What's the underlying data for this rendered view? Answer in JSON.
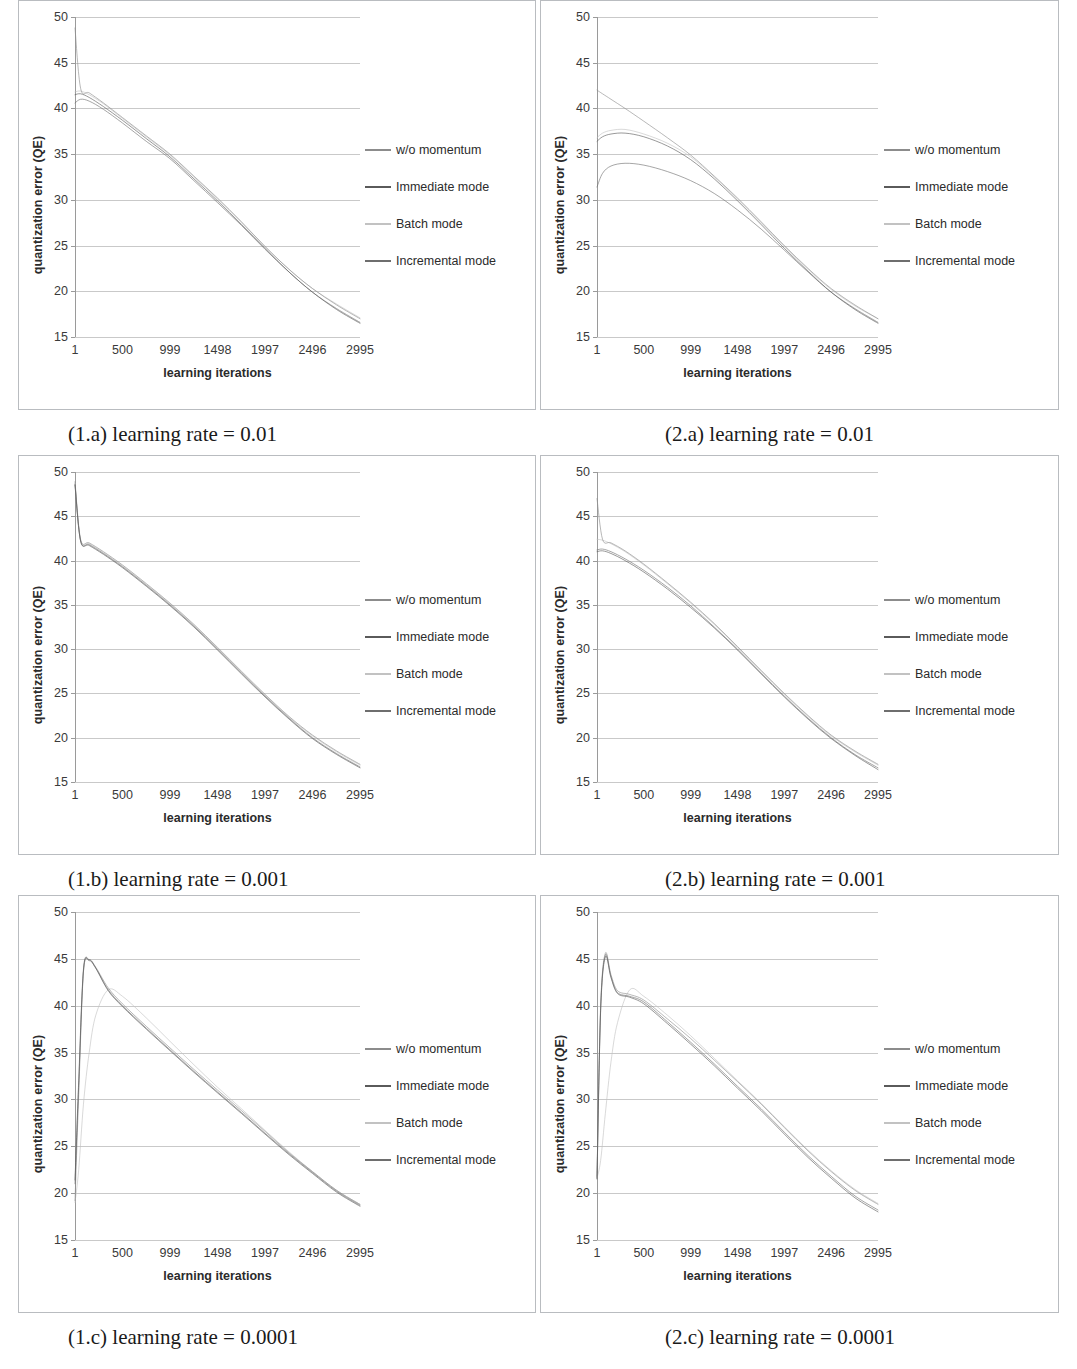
{
  "figure": {
    "rows": [
      {
        "left_caption": "(1.a) learning rate = 0.01",
        "right_caption": "(2.a) learning rate = 0.01"
      },
      {
        "left_caption": "(1.b) learning rate = 0.001",
        "right_caption": "(2.b) learning rate = 0.001"
      },
      {
        "left_caption": "(1.c) learning rate = 0.0001",
        "right_caption": "(2.c) learning rate = 0.0001"
      }
    ]
  },
  "axes": {
    "ylabel": "quantization error (QE)",
    "xlabel": "learning iterations",
    "yticks": [
      50,
      45,
      40,
      35,
      30,
      25,
      20,
      15
    ],
    "xticks": [
      1,
      500,
      999,
      1498,
      1997,
      2496,
      2995
    ],
    "ylim": [
      15,
      50
    ],
    "xlim": [
      1,
      2995
    ]
  },
  "legend": {
    "entries": [
      {
        "label": "w/o momentum",
        "color": "#8c8c8c"
      },
      {
        "label": "Immediate mode",
        "color": "#5a5a5a"
      },
      {
        "label": "Batch mode",
        "color": "#c2c2c2"
      },
      {
        "label": "Incremental mode",
        "color": "#6e6e6e"
      }
    ]
  },
  "colors": {
    "panel_border": "#b9bcc0",
    "gridline": "#c9c9c9",
    "axis": "#9a9a9a",
    "text": "#2b2b2b",
    "background": "#ffffff"
  },
  "chart_data": [
    {
      "id": "1a",
      "type": "line",
      "title": "(1.a) learning rate = 0.01",
      "xlabel": "learning iterations",
      "ylabel": "quantization error (QE)",
      "xlim": [
        1,
        2995
      ],
      "ylim": [
        15,
        50
      ],
      "grid": true,
      "legend_position": "right",
      "x": [
        1,
        60,
        150,
        300,
        500,
        750,
        999,
        1250,
        1498,
        1750,
        1997,
        2250,
        2496,
        2750,
        2995
      ],
      "series": [
        {
          "name": "w/o momentum",
          "color": "#8c8c8c",
          "values": [
            48.8,
            42.2,
            41.7,
            40.6,
            39.0,
            37.0,
            35.0,
            32.6,
            30.2,
            27.6,
            24.9,
            22.4,
            20.3,
            18.5,
            17.0
          ]
        },
        {
          "name": "Immediate mode",
          "color": "#5a5a5a",
          "values": [
            41.5,
            41.6,
            41.2,
            40.2,
            38.7,
            36.7,
            34.7,
            32.3,
            29.9,
            27.3,
            24.7,
            22.1,
            19.9,
            18.0,
            16.5
          ]
        },
        {
          "name": "Batch mode",
          "color": "#c2c2c2",
          "values": [
            41.8,
            41.9,
            41.5,
            40.5,
            38.9,
            36.9,
            34.9,
            32.5,
            30.1,
            27.5,
            24.9,
            22.4,
            20.3,
            18.6,
            17.1
          ]
        },
        {
          "name": "Incremental mode",
          "color": "#6e6e6e",
          "values": [
            40.6,
            41.0,
            40.8,
            39.9,
            38.4,
            36.4,
            34.5,
            32.1,
            29.7,
            27.2,
            24.6,
            22.1,
            19.9,
            18.1,
            16.6
          ]
        }
      ]
    },
    {
      "id": "2a",
      "type": "line",
      "title": "(2.a) learning rate = 0.01",
      "xlabel": "learning iterations",
      "ylabel": "quantization error (QE)",
      "xlim": [
        1,
        2995
      ],
      "ylim": [
        15,
        50
      ],
      "grid": true,
      "legend_position": "right",
      "x": [
        1,
        60,
        150,
        300,
        500,
        750,
        999,
        1250,
        1498,
        1750,
        1997,
        2250,
        2496,
        2750,
        2995
      ],
      "series": [
        {
          "name": "w/o momentum",
          "color": "#8c8c8c",
          "values": [
            42.0,
            41.6,
            41.0,
            40.0,
            38.6,
            36.8,
            34.9,
            32.6,
            30.2,
            27.6,
            25.0,
            22.5,
            20.3,
            18.5,
            17.0
          ]
        },
        {
          "name": "Immediate mode",
          "color": "#5a5a5a",
          "values": [
            36.4,
            36.9,
            37.2,
            37.3,
            36.9,
            35.9,
            34.4,
            32.3,
            29.9,
            27.3,
            24.7,
            22.2,
            19.9,
            18.0,
            16.5
          ]
        },
        {
          "name": "Batch mode",
          "color": "#c2c2c2",
          "values": [
            36.8,
            37.3,
            37.6,
            37.7,
            37.2,
            36.2,
            34.7,
            32.5,
            30.1,
            27.5,
            24.9,
            22.4,
            20.2,
            18.4,
            17.0
          ]
        },
        {
          "name": "Incremental mode",
          "color": "#6e6e6e",
          "values": [
            31.4,
            32.9,
            33.7,
            34.0,
            33.8,
            33.1,
            32.1,
            30.7,
            28.9,
            26.8,
            24.5,
            22.1,
            19.9,
            18.1,
            16.6
          ]
        }
      ]
    },
    {
      "id": "1b",
      "type": "line",
      "title": "(1.b) learning rate = 0.001",
      "xlabel": "learning iterations",
      "ylabel": "quantization error (QE)",
      "xlim": [
        1,
        2995
      ],
      "ylim": [
        15,
        50
      ],
      "grid": true,
      "legend_position": "right",
      "x": [
        1,
        60,
        150,
        300,
        500,
        750,
        999,
        1250,
        1498,
        1750,
        1997,
        2250,
        2496,
        2750,
        2995
      ],
      "series": [
        {
          "name": "w/o momentum",
          "color": "#8c8c8c",
          "values": [
            48.9,
            42.4,
            42.0,
            41.0,
            39.5,
            37.4,
            35.2,
            32.8,
            30.2,
            27.5,
            24.9,
            22.4,
            20.3,
            18.5,
            17.0
          ]
        },
        {
          "name": "Immediate mode",
          "color": "#5a5a5a",
          "values": [
            48.5,
            42.2,
            41.7,
            40.7,
            39.2,
            37.1,
            34.9,
            32.5,
            29.9,
            27.2,
            24.6,
            22.1,
            19.9,
            18.1,
            16.6
          ]
        },
        {
          "name": "Batch mode",
          "color": "#c2c2c2",
          "values": [
            48.7,
            42.3,
            41.9,
            40.9,
            39.4,
            37.3,
            35.1,
            32.7,
            30.1,
            27.4,
            24.8,
            22.3,
            20.2,
            18.4,
            16.9
          ]
        },
        {
          "name": "Incremental mode",
          "color": "#6e6e6e",
          "values": [
            48.6,
            42.2,
            41.8,
            40.8,
            39.3,
            37.2,
            35.0,
            32.6,
            30.0,
            27.3,
            24.7,
            22.2,
            20.0,
            18.2,
            16.7
          ]
        }
      ]
    },
    {
      "id": "2b",
      "type": "line",
      "title": "(2.b) learning rate = 0.001",
      "xlabel": "learning iterations",
      "ylabel": "quantization error (QE)",
      "xlim": [
        1,
        2995
      ],
      "ylim": [
        15,
        50
      ],
      "grid": true,
      "legend_position": "right",
      "x": [
        1,
        60,
        150,
        300,
        500,
        750,
        999,
        1250,
        1498,
        1750,
        1997,
        2250,
        2496,
        2750,
        2995
      ],
      "series": [
        {
          "name": "w/o momentum",
          "color": "#8c8c8c",
          "values": [
            47.0,
            42.4,
            42.0,
            41.1,
            39.6,
            37.5,
            35.3,
            32.9,
            30.3,
            27.6,
            25.0,
            22.5,
            20.3,
            18.5,
            17.0
          ]
        },
        {
          "name": "Immediate mode",
          "color": "#5a5a5a",
          "values": [
            41.0,
            41.1,
            40.8,
            40.0,
            38.7,
            36.8,
            34.7,
            32.4,
            29.9,
            27.2,
            24.6,
            22.1,
            19.9,
            18.0,
            16.4
          ]
        },
        {
          "name": "Batch mode",
          "color": "#c2c2c2",
          "values": [
            42.4,
            42.3,
            41.9,
            41.0,
            39.5,
            37.4,
            35.2,
            32.8,
            30.2,
            27.5,
            24.9,
            22.4,
            20.2,
            18.4,
            16.9
          ]
        },
        {
          "name": "Incremental mode",
          "color": "#6e6e6e",
          "values": [
            41.2,
            41.3,
            41.0,
            40.2,
            38.9,
            37.0,
            34.9,
            32.5,
            30.0,
            27.3,
            24.7,
            22.2,
            20.0,
            18.1,
            16.6
          ]
        }
      ]
    },
    {
      "id": "1c",
      "type": "line",
      "title": "(1.c) learning rate = 0.0001",
      "xlabel": "learning iterations",
      "ylabel": "quantization error (QE)",
      "xlim": [
        1,
        2995
      ],
      "ylim": [
        15,
        50
      ],
      "grid": true,
      "legend_position": "right",
      "x": [
        1,
        40,
        90,
        150,
        220,
        350,
        500,
        750,
        999,
        1250,
        1498,
        1750,
        1997,
        2250,
        2496,
        2750,
        2995
      ],
      "series": [
        {
          "name": "w/o momentum",
          "color": "#8c8c8c",
          "values": [
            19.2,
            30.5,
            43.6,
            44.9,
            44.1,
            41.9,
            40.2,
            37.8,
            35.5,
            33.2,
            31.0,
            28.8,
            26.6,
            24.3,
            22.3,
            20.3,
            18.8
          ]
        },
        {
          "name": "Immediate mode",
          "color": "#5a5a5a",
          "values": [
            21.4,
            32.0,
            43.9,
            44.9,
            44.0,
            41.6,
            39.9,
            37.5,
            35.2,
            32.9,
            30.7,
            28.5,
            26.3,
            24.1,
            22.1,
            20.1,
            18.6
          ]
        },
        {
          "name": "Batch mode",
          "color": "#c2c2c2",
          "values": [
            19.0,
            22.5,
            29.5,
            35.0,
            39.0,
            41.7,
            41.0,
            38.7,
            36.2,
            33.7,
            31.3,
            29.0,
            26.7,
            24.4,
            22.3,
            20.3,
            18.8
          ]
        },
        {
          "name": "Incremental mode",
          "color": "#6e6e6e",
          "values": [
            21.0,
            31.5,
            43.7,
            44.8,
            44.0,
            41.7,
            40.0,
            37.6,
            35.3,
            33.0,
            30.8,
            28.6,
            26.4,
            24.2,
            22.2,
            20.2,
            18.7
          ]
        }
      ]
    },
    {
      "id": "2c",
      "type": "line",
      "title": "(2.c) learning rate = 0.0001",
      "xlabel": "learning iterations",
      "ylabel": "quantization error (QE)",
      "xlim": [
        1,
        2995
      ],
      "ylim": [
        15,
        50
      ],
      "grid": true,
      "legend_position": "right",
      "x": [
        1,
        40,
        90,
        150,
        220,
        350,
        500,
        750,
        999,
        1250,
        1498,
        1750,
        1997,
        2250,
        2496,
        2750,
        2995
      ],
      "series": [
        {
          "name": "w/o momentum",
          "color": "#8c8c8c",
          "values": [
            21.8,
            40.0,
            45.6,
            43.3,
            41.6,
            41.2,
            40.6,
            38.6,
            36.5,
            34.2,
            31.9,
            29.5,
            27.0,
            24.5,
            22.3,
            20.3,
            18.8
          ]
        },
        {
          "name": "Immediate mode",
          "color": "#5a5a5a",
          "values": [
            21.5,
            39.5,
            45.2,
            43.0,
            41.3,
            40.9,
            40.2,
            38.1,
            35.9,
            33.6,
            31.2,
            28.8,
            26.3,
            23.8,
            21.6,
            19.5,
            18.0
          ]
        },
        {
          "name": "Batch mode",
          "color": "#c2c2c2",
          "values": [
            21.6,
            23.5,
            28.5,
            34.0,
            38.2,
            41.7,
            41.0,
            39.0,
            36.8,
            34.4,
            32.0,
            29.6,
            27.1,
            24.6,
            22.4,
            20.4,
            18.9
          ]
        },
        {
          "name": "Incremental mode",
          "color": "#6e6e6e",
          "values": [
            21.6,
            39.7,
            45.4,
            43.1,
            41.4,
            41.0,
            40.4,
            38.3,
            36.1,
            33.8,
            31.4,
            29.0,
            26.5,
            24.0,
            21.8,
            19.7,
            18.2
          ]
        }
      ]
    }
  ]
}
